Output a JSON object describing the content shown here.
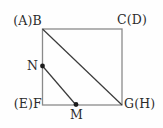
{
  "diagram": {
    "type": "geometry-figure",
    "colors": {
      "background": "#fefefe",
      "square": "#8a8a8a",
      "line": "#3a3a3a",
      "dot": "#1c1c1c",
      "text": "#2b2b2b"
    },
    "labels": {
      "top_left": "(A)B",
      "top_right": "C(D)",
      "bottom_left": "(E)F",
      "bottom_right": "G(H)",
      "left_point": "N",
      "bottom_point": "M"
    }
  }
}
